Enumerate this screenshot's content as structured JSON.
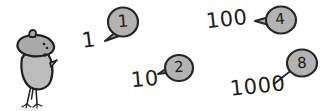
{
  "canvas": {
    "width": 329,
    "height": 111,
    "background_color": "#ffffff"
  },
  "palette": {
    "ink": "#1c1c1c",
    "bubble_fill": "#b3b3b3",
    "bubble_stroke": "#262626",
    "bird_fill": "#b8b8b8",
    "bird_cap_fill": "#a8a8a8",
    "bird_stroke": "#1f1f1f"
  },
  "character": {
    "name": "bird-character",
    "description": "cartoon bird wearing a beret",
    "parts": [
      "beret-cap",
      "cap-stem",
      "body",
      "eye",
      "beak",
      "legs",
      "feet"
    ]
  },
  "number_labels": [
    {
      "id": "label-1",
      "text": "1"
    },
    {
      "id": "label-10",
      "text": "10"
    },
    {
      "id": "label-100",
      "text": "100"
    },
    {
      "id": "label-1000",
      "text": "1000"
    }
  ],
  "speech_bubbles": [
    {
      "id": "bubble-1",
      "digit": "1",
      "tail_direction": "lower-left",
      "annotates": "1"
    },
    {
      "id": "bubble-2",
      "digit": "2",
      "tail_direction": "left",
      "annotates": "10"
    },
    {
      "id": "bubble-4",
      "digit": "4",
      "tail_direction": "left",
      "annotates": "100"
    },
    {
      "id": "bubble-8",
      "digit": "8",
      "tail_direction": "lower-left",
      "annotates": "1000"
    }
  ]
}
